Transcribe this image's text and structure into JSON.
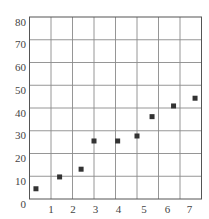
{
  "chart_data": {
    "type": "scatter",
    "title": "",
    "xlabel": "",
    "ylabel": "",
    "xlim": [
      0,
      8
    ],
    "ylim": [
      0,
      80
    ],
    "grid": true,
    "legend": null,
    "x_ticks": [
      1,
      2,
      3,
      4,
      5,
      6,
      7
    ],
    "x_tick_labels": [
      "1",
      "2",
      "3",
      "4",
      "5",
      "6",
      "7"
    ],
    "y_ticks": [
      0,
      10,
      20,
      30,
      40,
      50,
      60,
      70,
      80
    ],
    "y_tick_labels": [
      "0",
      "10",
      "20",
      "30",
      "40",
      "50",
      "60",
      "70",
      "80"
    ],
    "series": [
      {
        "name": "data",
        "marker": "square",
        "color": "#333333",
        "x": [
          0.3,
          1.4,
          2.4,
          3.0,
          4.1,
          5.0,
          5.7,
          6.7,
          7.7
        ],
        "y": [
          4.5,
          9.7,
          13.1,
          25.5,
          25.5,
          27.7,
          36.2,
          40.9,
          44.3
        ]
      }
    ]
  },
  "style": {
    "grid_color": "#8a8a8a",
    "axis_color": "#555555",
    "marker_color": "#333333",
    "label_color": "#444444"
  }
}
